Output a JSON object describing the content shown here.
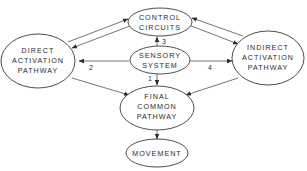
{
  "diagram": {
    "type": "flow-diagram",
    "nodes": {
      "control_circuits": {
        "line1": "CONTROL",
        "line2": "CIRCUITS"
      },
      "sensory_system": {
        "line1": "SENSORY",
        "line2": "SYSTEM"
      },
      "direct_pathway": {
        "line1": "DIRECT",
        "line2": "ACTIVATION",
        "line3": "PATHWAY"
      },
      "indirect_pathway": {
        "line1": "INDIRECT",
        "line2": "ACTIVATION",
        "line3": "PATHWAY"
      },
      "final_common_pathway": {
        "line1": "FINAL",
        "line2": "COMMON",
        "line3": "PATHWAY"
      },
      "movement": {
        "line1": "MOVEMENT"
      }
    },
    "edge_labels": {
      "sensory_to_final": "1",
      "sensory_to_direct": "2",
      "sensory_to_control": "3",
      "sensory_to_indirect": "4"
    },
    "edges": [
      {
        "from": "direct_pathway",
        "to": "control_circuits"
      },
      {
        "from": "control_circuits",
        "to": "direct_pathway"
      },
      {
        "from": "indirect_pathway",
        "to": "control_circuits"
      },
      {
        "from": "control_circuits",
        "to": "indirect_pathway"
      },
      {
        "from": "sensory_system",
        "to": "control_circuits",
        "label": "3"
      },
      {
        "from": "sensory_system",
        "to": "direct_pathway",
        "label": "2"
      },
      {
        "from": "sensory_system",
        "to": "indirect_pathway",
        "label": "4"
      },
      {
        "from": "sensory_system",
        "to": "final_common_pathway",
        "label": "1"
      },
      {
        "from": "direct_pathway",
        "to": "final_common_pathway"
      },
      {
        "from": "indirect_pathway",
        "to": "final_common_pathway"
      },
      {
        "from": "final_common_pathway",
        "to": "movement"
      }
    ]
  }
}
